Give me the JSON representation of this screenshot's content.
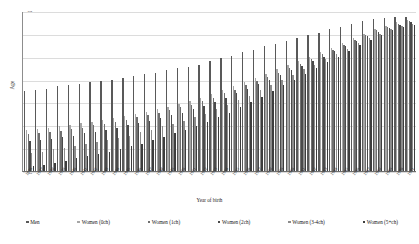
{
  "chart_data": {
    "type": "bar",
    "title": "",
    "subtitle": "",
    "xlabel": "Year of birth",
    "ylabel": "Age",
    "ylim": [
      53,
      67
    ],
    "yticks": [
      67,
      65,
      63,
      61,
      59,
      57,
      55,
      53
    ],
    "grid": true,
    "legend_position": "bottom",
    "orientation": "vertical-grouped",
    "categories": [
      "1936",
      "1937",
      "1938",
      "1939",
      "1940",
      "1941",
      "1942",
      "1943",
      "1944",
      "1945",
      "1946",
      "1947",
      "1948",
      "1949",
      "1950",
      "1951",
      "1952",
      "1953",
      "1954",
      "1955",
      "1956",
      "1957",
      "1958",
      "1959",
      "1960",
      "1961",
      "1962",
      "1963",
      "1964",
      "1965",
      "1966",
      "1967",
      "1968",
      "1969",
      "1970",
      "1971"
    ],
    "series": [
      {
        "name": "Men",
        "color": "#595959",
        "values": [
          60.0,
          60.1,
          60.2,
          60.4,
          60.5,
          60.6,
          60.8,
          60.9,
          61.0,
          61.1,
          61.3,
          61.5,
          61.6,
          61.8,
          62.0,
          62.1,
          62.3,
          62.6,
          62.9,
          63.1,
          63.4,
          63.6,
          63.9,
          64.1,
          64.4,
          64.6,
          64.9,
          65.1,
          65.4,
          65.6,
          65.9,
          66.1,
          66.3,
          66.4,
          66.5,
          66.5
        ]
      },
      {
        "name": "Women (0ch)",
        "color": "#a6a6a6",
        "values": [
          56.6,
          56.7,
          56.8,
          56.9,
          57.0,
          57.2,
          57.3,
          57.5,
          57.6,
          57.8,
          58.0,
          58.2,
          58.4,
          58.6,
          58.9,
          59.1,
          59.4,
          59.7,
          60.1,
          60.4,
          60.8,
          61.1,
          61.5,
          61.9,
          62.3,
          62.6,
          63.0,
          63.4,
          63.8,
          64.2,
          64.6,
          65.0,
          65.4,
          65.7,
          66.0,
          66.2
        ]
      },
      {
        "name": "Women (1ch)",
        "color": "#6f6f6f",
        "values": [
          56.2,
          56.3,
          56.4,
          56.5,
          56.7,
          56.8,
          57.0,
          57.1,
          57.3,
          57.5,
          57.7,
          57.9,
          58.1,
          58.3,
          58.6,
          58.8,
          59.1,
          59.4,
          59.8,
          60.1,
          60.5,
          60.9,
          61.2,
          61.6,
          62.0,
          62.4,
          62.8,
          63.2,
          63.6,
          64.0,
          64.5,
          64.9,
          65.3,
          65.6,
          65.9,
          66.1
        ]
      },
      {
        "name": "Women (2ch)",
        "color": "#4a4a4a",
        "values": [
          55.6,
          55.7,
          55.8,
          56.0,
          56.1,
          56.3,
          56.4,
          56.6,
          56.8,
          57.0,
          57.2,
          57.4,
          57.6,
          57.9,
          58.1,
          58.4,
          58.7,
          59.0,
          59.4,
          59.8,
          60.2,
          60.6,
          61.0,
          61.4,
          61.8,
          62.2,
          62.6,
          63.0,
          63.5,
          63.9,
          64.4,
          64.8,
          65.2,
          65.5,
          65.8,
          66.0
        ]
      },
      {
        "name": "Women (3-4ch)",
        "color": "#8c8c8c",
        "values": [
          54.6,
          54.7,
          54.9,
          55.0,
          55.2,
          55.4,
          55.5,
          55.7,
          55.9,
          56.1,
          56.4,
          56.6,
          56.9,
          57.1,
          57.4,
          57.7,
          58.0,
          58.4,
          58.8,
          59.2,
          59.6,
          60.1,
          60.5,
          61.0,
          61.4,
          61.9,
          62.3,
          62.8,
          63.2,
          63.7,
          64.2,
          64.6,
          65.0,
          65.4,
          65.7,
          65.9
        ]
      },
      {
        "name": "Women (5+ch)",
        "color": "#3d3d3d",
        "values": [
          53.4,
          53.5,
          53.7,
          53.9,
          54.1,
          54.3,
          54.5,
          54.7,
          54.9,
          55.2,
          55.4,
          55.7,
          56.0,
          56.3,
          56.6,
          56.9,
          57.3,
          57.7,
          58.1,
          58.6,
          59.0,
          59.5,
          60.0,
          60.5,
          61.0,
          61.5,
          62.0,
          62.5,
          63.0,
          63.5,
          64.0,
          64.5,
          64.9,
          65.3,
          65.6,
          65.8
        ]
      }
    ]
  }
}
